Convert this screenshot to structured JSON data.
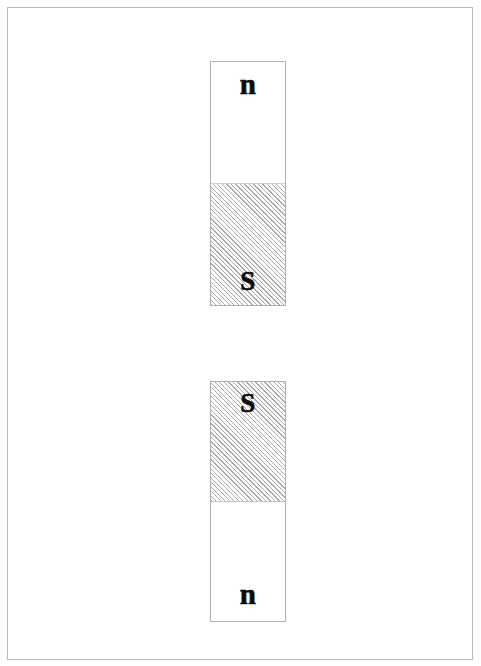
{
  "figure": {
    "type": "bar-magnet-diagram",
    "page_background": "#ffffff",
    "frame_color": "#b9b9b9",
    "hatch_color": "#a9a9a9",
    "label_color": "#0a0a0a"
  },
  "magnets": [
    {
      "id": "magnet-top",
      "poles": [
        {
          "position": "top",
          "label": "n",
          "fill": "plain"
        },
        {
          "position": "bottom",
          "label": "S",
          "fill": "hatched"
        }
      ]
    },
    {
      "id": "magnet-bottom",
      "poles": [
        {
          "position": "top",
          "label": "S",
          "fill": "hatched"
        },
        {
          "position": "bottom",
          "label": "n",
          "fill": "plain"
        }
      ]
    }
  ]
}
